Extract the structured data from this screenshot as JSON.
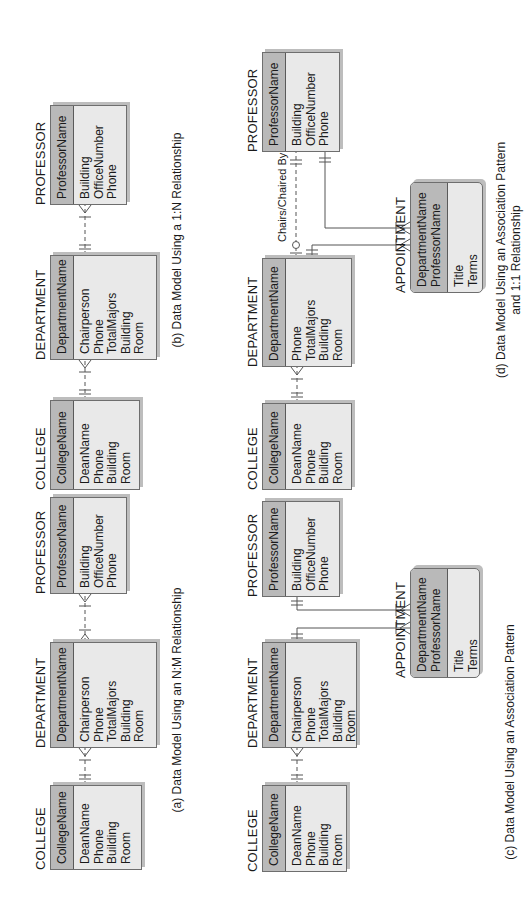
{
  "orientation": "rotated-90-counterclockwise",
  "colors": {
    "key_fill": "#b9b9b9",
    "attr_fill": "#e9e9e9",
    "border": "#6e6e6e",
    "line": "#555555"
  },
  "diagrams": {
    "a": {
      "caption": "(a) Data Model Using an N:M Relationship",
      "college": {
        "name": "COLLEGE",
        "keys": [
          "CollegeName"
        ],
        "attrs": [
          "DeanName",
          "Phone",
          "Building",
          "Room"
        ]
      },
      "department": {
        "name": "DEPARTMENT",
        "keys": [
          "DepartmentName"
        ],
        "attrs": [
          "Chairperson",
          "Phone",
          "TotalMajors",
          "Building",
          "Room"
        ]
      },
      "professor": {
        "name": "PROFESSOR",
        "keys": [
          "ProfessorName"
        ],
        "attrs": [
          "Building",
          "OfficeNumber",
          "Phone"
        ]
      }
    },
    "b": {
      "caption": "(b) Data Model Using a 1:N Relationship",
      "college": {
        "name": "COLLEGE",
        "keys": [
          "CollegeName"
        ],
        "attrs": [
          "DeanName",
          "Phone",
          "Building",
          "Room"
        ]
      },
      "department": {
        "name": "DEPARTMENT",
        "keys": [
          "DepartmentName"
        ],
        "attrs": [
          "Chairperson",
          "Phone",
          "TotalMajors",
          "Building",
          "Room"
        ]
      },
      "professor": {
        "name": "PROFESSOR",
        "keys": [
          "ProfessorName"
        ],
        "attrs": [
          "Building",
          "OfficeNumber",
          "Phone"
        ]
      }
    },
    "c": {
      "caption": "(c) Data Model Using an Association Pattern",
      "college": {
        "name": "COLLEGE",
        "keys": [
          "CollegeName"
        ],
        "attrs": [
          "DeanName",
          "Phone",
          "Building",
          "Room"
        ]
      },
      "department": {
        "name": "DEPARTMENT",
        "keys": [
          "DepartmentName"
        ],
        "attrs": [
          "Chairperson",
          "Phone",
          "TotalMajors",
          "Building",
          "Room"
        ]
      },
      "professor": {
        "name": "PROFESSOR",
        "keys": [
          "ProfessorName"
        ],
        "attrs": [
          "Building",
          "OfficeNumber",
          "Phone"
        ]
      },
      "appointment": {
        "name": "APPOINTMENT",
        "keys": [
          "DepartmentName",
          "ProfessorName"
        ],
        "attrs": [
          "Title",
          "Terms"
        ]
      }
    },
    "d": {
      "caption_line1": "(d) Data Model Using an Association Pattern",
      "caption_line2": "and 1:1 Relationship",
      "relationship_label": "Chairs/Chaired By",
      "college": {
        "name": "COLLEGE",
        "keys": [
          "CollegeName"
        ],
        "attrs": [
          "DeanName",
          "Phone",
          "Building",
          "Room"
        ]
      },
      "department": {
        "name": "DEPARTMENT",
        "keys": [
          "DepartmentName"
        ],
        "attrs": [
          "Phone",
          "TotalMajors",
          "Building",
          "Room"
        ]
      },
      "professor": {
        "name": "PROFESSOR",
        "keys": [
          "ProfessorName"
        ],
        "attrs": [
          "Building",
          "OfficeNumber",
          "Phone"
        ]
      },
      "appointment": {
        "name": "APPOINTMENT",
        "keys": [
          "DepartmentName",
          "ProfessorName"
        ],
        "attrs": [
          "Title",
          "Terms"
        ]
      }
    }
  }
}
